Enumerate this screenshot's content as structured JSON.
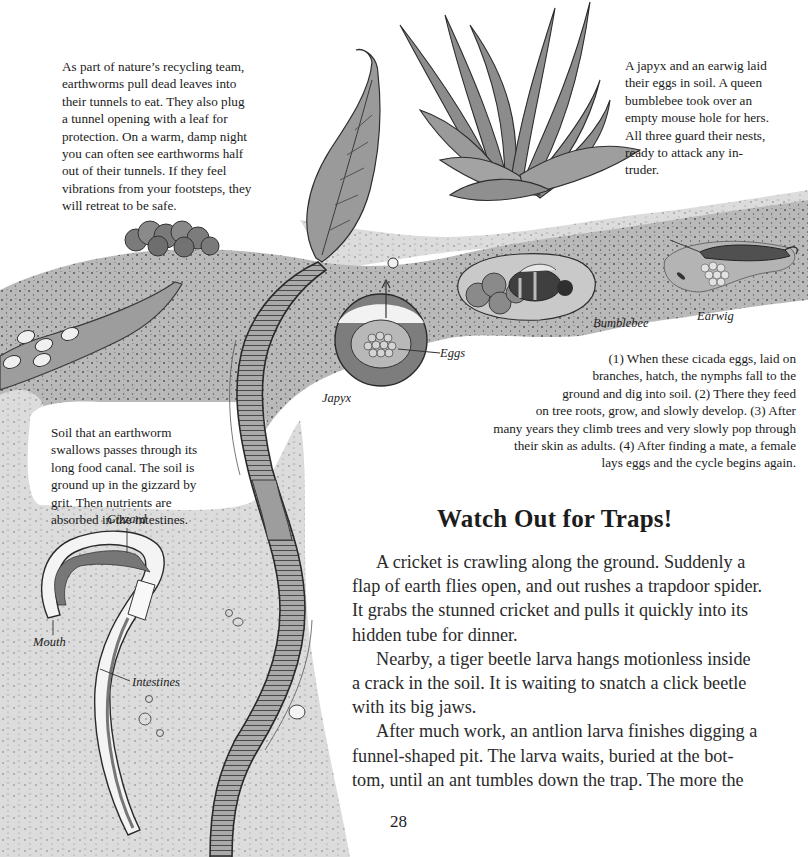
{
  "page": {
    "number": "28",
    "heading": "Watch Out for Traps!"
  },
  "captions": {
    "recycling": [
      "As part of nature’s recycling team,",
      "earthworms pull dead leaves into",
      "their tunnels to eat. They also plug",
      "a tunnel opening with a leaf for",
      "protection. On a warm, damp night",
      "you can often see earthworms half",
      "out of their tunnels. If they feel",
      "vibrations from your footsteps, they",
      "will retreat to be safe."
    ],
    "nests": [
      "A japyx and an earwig laid",
      "their eggs in soil. A queen",
      "bumblebee took over an",
      "empty mouse hole for hers.",
      "All three guard their nests,",
      "ready to attack any in-",
      "truder."
    ],
    "cicada": [
      "(1) When these cicada eggs, laid on",
      "branches, hatch, the nymphs fall to the",
      "ground and dig into soil. (2) There they feed",
      "on tree roots, grow, and slowly develop. (3) After",
      "many years they climb trees and very slowly pop through",
      "their skin as adults. (4) After finding a mate, a female",
      "lays eggs and the cycle begins again."
    ],
    "soil": [
      "Soil that an earthworm",
      "swallows passes through its",
      "long food canal. The soil is",
      "ground up in the gizzard by",
      "grit. Then nutrients are",
      "absorbed in the intestines."
    ]
  },
  "labels": {
    "bumblebee": "Bumblebee",
    "earwig": "Earwig",
    "eggs": "Eggs",
    "japyx": "Japyx",
    "gizzard": "Gizzard",
    "mouth": "Mouth",
    "intestines": "Intestines"
  },
  "body": [
    {
      "text": "A cricket is crawling along the ground. Suddenly a",
      "indent": true
    },
    {
      "text": "flap of earth flies open, and out rushes a trapdoor spider.",
      "indent": false
    },
    {
      "text": "It grabs the stunned cricket and pulls it quickly into its",
      "indent": false
    },
    {
      "text": "hidden tube for dinner.",
      "indent": false
    },
    {
      "text": "Nearby, a tiger beetle larva hangs motionless inside",
      "indent": true
    },
    {
      "text": "a crack in the soil. It is waiting to snatch a click beetle",
      "indent": false
    },
    {
      "text": "with its big jaws.",
      "indent": false
    },
    {
      "text": "After much work, an antlion larva finishes digging a",
      "indent": true
    },
    {
      "text": "funnel-shaped pit. The larva waits, buried at the bot-",
      "indent": false
    },
    {
      "text": "tom, until an ant tumbles down the trap. The more the",
      "indent": false
    }
  ],
  "illustration": {
    "subjects": [
      "earthworm-icon",
      "leaf-icon",
      "grass-plant-icon",
      "worm-castings-icon",
      "cicada-eggs-icon",
      "japyx-nest-icon",
      "bumblebee-nest-icon",
      "earwig-nest-icon",
      "worm-anatomy-icon"
    ],
    "colors": {
      "soil_dark": "#6e6e6e",
      "soil_mid": "#a6a6a6",
      "soil_light": "#d9d9d9",
      "ink": "#2b2b2b",
      "paper": "#ffffff"
    }
  }
}
